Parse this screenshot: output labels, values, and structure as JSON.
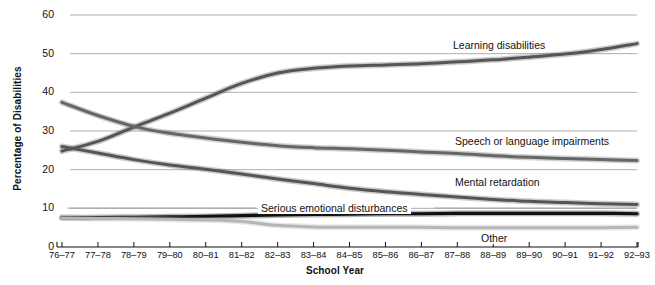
{
  "chart_data": {
    "type": "line",
    "title": "",
    "xlabel": "School Year",
    "ylabel": "Percentage of Disabilities",
    "ylim": [
      0,
      60
    ],
    "y_ticks": [
      0,
      10,
      20,
      30,
      40,
      50,
      60
    ],
    "grid": "horizontal",
    "legend": "inline-annotations",
    "categories": [
      "76–77",
      "77–78",
      "78–79",
      "79–80",
      "80–81",
      "81–82",
      "82–83",
      "83–84",
      "84–85",
      "85–86",
      "86–87",
      "87–88",
      "88–89",
      "89–90",
      "90–91",
      "91–92",
      "92–93"
    ],
    "series": [
      {
        "name": "Learning disabilities",
        "color": "#555555",
        "label_x": 450,
        "label_y": 39,
        "values": [
          24.8,
          27.3,
          31.0,
          34.6,
          38.5,
          42.3,
          45.0,
          46.2,
          46.8,
          47.1,
          47.4,
          47.9,
          48.4,
          49.1,
          49.9,
          51.1,
          52.6
        ]
      },
      {
        "name": "Speech or language impairments",
        "color": "#666666",
        "label_x": 452,
        "label_y": 135,
        "values": [
          37.4,
          34.0,
          31.2,
          29.4,
          28.2,
          27.1,
          26.2,
          25.7,
          25.4,
          25.0,
          24.6,
          24.2,
          23.6,
          23.2,
          22.9,
          22.6,
          22.4
        ]
      },
      {
        "name": "Mental retardation",
        "color": "#555555",
        "label_x": 452,
        "label_y": 176,
        "values": [
          26.0,
          24.3,
          22.6,
          21.2,
          20.1,
          18.9,
          17.6,
          16.4,
          15.2,
          14.3,
          13.6,
          12.9,
          12.3,
          11.8,
          11.5,
          11.2,
          11.0
        ]
      },
      {
        "name": "Serious emotional disturbances",
        "color": "#111111",
        "label_x": 258,
        "label_y": 202,
        "values": [
          7.6,
          7.6,
          7.7,
          7.8,
          7.9,
          8.1,
          8.3,
          8.4,
          8.5,
          8.6,
          8.6,
          8.7,
          8.7,
          8.7,
          8.7,
          8.7,
          8.6
        ]
      },
      {
        "name": "Other",
        "color": "#b5b5b5",
        "label_x": 478,
        "label_y": 232,
        "values": [
          7.5,
          7.4,
          7.3,
          7.2,
          7.0,
          6.6,
          5.6,
          5.2,
          5.1,
          5.1,
          5.1,
          5.0,
          5.0,
          5.0,
          5.0,
          5.0,
          5.1
        ]
      }
    ]
  }
}
